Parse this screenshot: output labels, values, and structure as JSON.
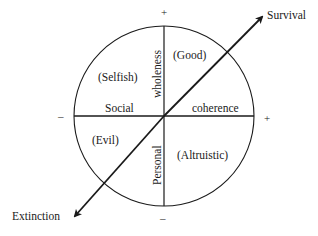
{
  "diagram": {
    "axes": {
      "horizontal": {
        "left_label": "Social",
        "right_label": "coherence",
        "neg_sign": "–",
        "pos_sign": "+"
      },
      "vertical": {
        "upper_label": "wholeness",
        "lower_label": "Personal",
        "pos_sign": "+",
        "neg_sign": "–"
      },
      "diagonal": {
        "upper_end_label": "Survival",
        "lower_end_label": "Extinction"
      }
    },
    "quadrants": {
      "upper_left": "(Selfish)",
      "upper_right": "(Good)",
      "lower_left": "(Evil)",
      "lower_right": "(Altruistic)"
    },
    "colors": {
      "line": "#1a1a1a",
      "background": "#ffffff"
    }
  }
}
